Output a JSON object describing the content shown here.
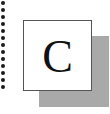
{
  "icon": {
    "letter": "C",
    "card_color": "#ffffff",
    "border_color": "#555555",
    "shadow_color": "#a9a9a9",
    "letter_color": "#111111"
  },
  "dots": {
    "count": 13,
    "spacing_px": 7,
    "color": "#1a1a1a"
  }
}
